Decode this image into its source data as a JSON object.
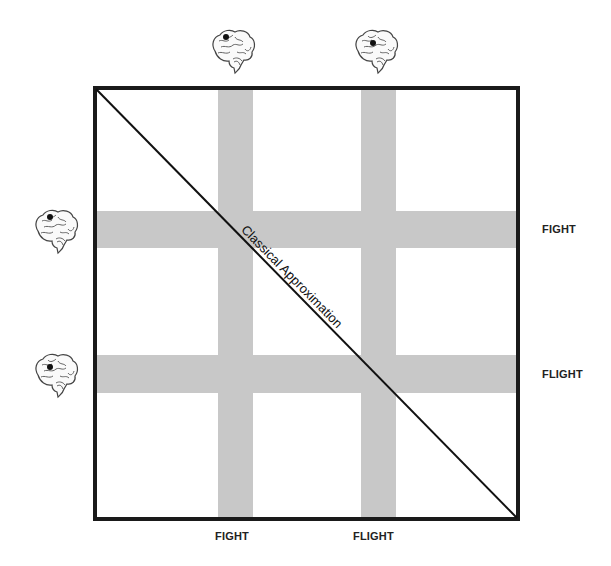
{
  "diagram": {
    "diagonal_label": "Classical Approximation",
    "column_labels": [
      "FIGHT",
      "FLIGHT"
    ],
    "row_labels": [
      "FIGHT",
      "FLIGHT"
    ],
    "icons": {
      "top": [
        "brain-icon",
        "brain-icon"
      ],
      "left": [
        "brain-icon",
        "brain-icon"
      ]
    },
    "colors": {
      "border": "#1a1a1a",
      "band": "#c8c8c8",
      "background": "#ffffff"
    }
  }
}
